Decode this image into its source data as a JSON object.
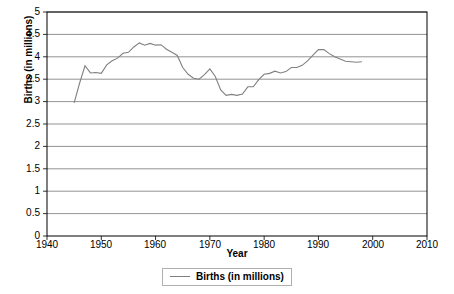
{
  "chart_data": {
    "type": "line",
    "title": "",
    "xlabel": "Year",
    "ylabel": "Births (in millions)",
    "xlim": [
      1940,
      2010
    ],
    "ylim": [
      0,
      5
    ],
    "xticks": [
      "1940",
      "1950",
      "1960",
      "1970",
      "1980",
      "1990",
      "2000",
      "2010"
    ],
    "yticks": [
      "0",
      "0.5",
      "1",
      "1.5",
      "2",
      "2.5",
      "3",
      "3.5",
      "4",
      "4.5",
      "5"
    ],
    "grid": "horizontal",
    "legend_position": "bottom-center",
    "series": [
      {
        "name": "Births (in millions)",
        "color": "#808080",
        "x": [
          1945,
          1946,
          1947,
          1948,
          1949,
          1950,
          1951,
          1952,
          1953,
          1954,
          1955,
          1956,
          1957,
          1958,
          1959,
          1960,
          1961,
          1962,
          1963,
          1964,
          1965,
          1966,
          1967,
          1968,
          1969,
          1970,
          1971,
          1972,
          1973,
          1974,
          1975,
          1976,
          1977,
          1978,
          1979,
          1980,
          1981,
          1982,
          1983,
          1984,
          1985,
          1986,
          1987,
          1988,
          1989,
          1990,
          1991,
          1992,
          1993,
          1994,
          1995,
          1996,
          1997,
          1998
        ],
        "values": [
          2.97,
          3.41,
          3.8,
          3.64,
          3.65,
          3.63,
          3.82,
          3.91,
          3.97,
          4.08,
          4.1,
          4.22,
          4.31,
          4.26,
          4.3,
          4.26,
          4.27,
          4.17,
          4.1,
          4.03,
          3.76,
          3.61,
          3.52,
          3.5,
          3.6,
          3.73,
          3.56,
          3.26,
          3.14,
          3.16,
          3.14,
          3.17,
          3.33,
          3.33,
          3.49,
          3.61,
          3.63,
          3.68,
          3.64,
          3.67,
          3.76,
          3.76,
          3.81,
          3.91,
          4.04,
          4.16,
          4.16,
          4.07,
          4.0,
          3.95,
          3.9,
          3.89,
          3.88,
          3.89
        ]
      }
    ]
  },
  "legend": {
    "entries": [
      {
        "label": "Births (in millions)",
        "color": "#808080"
      }
    ]
  },
  "axes": {
    "x_axis_label": "Year",
    "y_axis_label": "Births (in millions)"
  }
}
